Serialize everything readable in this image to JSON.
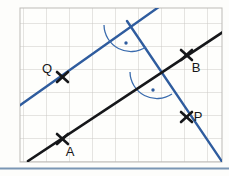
{
  "figure": {
    "kind": "geometry-diagram",
    "canvas": {
      "width": 229,
      "height": 176
    },
    "background_color": "#fdfdfb",
    "grid": {
      "visible": true,
      "x0": 20,
      "y0": 8,
      "x1": 222,
      "y1": 162,
      "cell_size": 23,
      "line_color": "#c8c6c2",
      "paper_color": "#fefefc",
      "border_color": "#bdbbb7"
    },
    "colors": {
      "black_line": "#16171a",
      "blue_line": "#2f5c9e",
      "label_text": "#16171a",
      "arc_stroke": "#3a6bad",
      "bottom_rule": "#7a96b4"
    },
    "lines": [
      {
        "id": "line-ab",
        "name": "black-line-AB",
        "color_key": "black_line",
        "stroke_width": 2.6,
        "x1": 28,
        "y1": 161,
        "x2": 223,
        "y2": 32
      },
      {
        "id": "line-q",
        "name": "blue-line-through-Q",
        "color_key": "blue_line",
        "stroke_width": 2.4,
        "x1": 19,
        "y1": 106,
        "x2": 163,
        "y2": 4
      },
      {
        "id": "line-p",
        "name": "blue-line-through-P",
        "color_key": "blue_line",
        "stroke_width": 2.4,
        "x1": 127,
        "y1": 21,
        "x2": 223,
        "y2": 163
      }
    ],
    "points": [
      {
        "id": "pt-q",
        "label": "Q",
        "x": 63,
        "y": 77,
        "label_x": 47,
        "label_y": 72,
        "marker": "x-cross"
      },
      {
        "id": "pt-b",
        "label": "B",
        "x": 186,
        "y": 55,
        "label_x": 192,
        "label_y": 72,
        "marker": "x-cross"
      },
      {
        "id": "pt-p",
        "label": "P",
        "x": 186,
        "y": 117,
        "label_x": 194,
        "label_y": 120,
        "marker": "x-cross"
      },
      {
        "id": "pt-a",
        "label": "A",
        "x": 62,
        "y": 139,
        "label_x": 67,
        "label_y": 155,
        "marker": "x-cross"
      }
    ],
    "right_angle_markers": [
      {
        "id": "angle-upper",
        "name": "right-angle-marker-upper",
        "vertex_x": 131,
        "vertex_y": 25,
        "radius": 27,
        "start_angle_deg": 180,
        "end_angle_deg": 56,
        "dot_x": 126,
        "dot_y": 42
      },
      {
        "id": "angle-lower",
        "name": "right-angle-marker-lower",
        "vertex_x": 157,
        "vertex_y": 72,
        "radius": 27,
        "start_angle_deg": 180,
        "end_angle_deg": 56,
        "dot_x": 157,
        "dot_y": 89
      }
    ],
    "bottom_rule": {
      "y": 168,
      "thickness": 2
    }
  }
}
